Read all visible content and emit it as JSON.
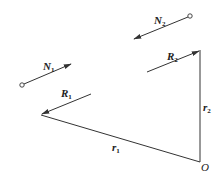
{
  "diagram": {
    "type": "vector-triangle",
    "colors": {
      "stroke": "#333333",
      "background": "#ffffff"
    },
    "labels": {
      "N2": {
        "main": "N",
        "sub": "2"
      },
      "N1": {
        "main": "N",
        "sub": "1"
      },
      "R2": {
        "main": "R",
        "sub": "2"
      },
      "R1": {
        "main": "R",
        "sub": "1"
      },
      "r2": {
        "main": "r",
        "sub": "2"
      },
      "r1": {
        "main": "r",
        "sub": "1"
      },
      "O": {
        "main": "O"
      }
    },
    "vectors": [
      {
        "name": "N2",
        "from": [
          190,
          16
        ],
        "to": [
          134,
          39
        ],
        "tail": "circle"
      },
      {
        "name": "N1",
        "from": [
          22,
          85
        ],
        "to": [
          71,
          64
        ],
        "tail": "circle"
      },
      {
        "name": "R2",
        "from": [
          147,
          72
        ],
        "to": [
          200,
          50
        ],
        "tail": "none"
      },
      {
        "name": "R1",
        "from": [
          91,
          94
        ],
        "to": [
          41,
          115
        ],
        "tail": "none"
      }
    ],
    "segments": [
      {
        "name": "r2",
        "from": [
          200,
          50
        ],
        "to": [
          200,
          162
        ]
      },
      {
        "name": "r1",
        "from": [
          41,
          115
        ],
        "to": [
          200,
          162
        ]
      }
    ],
    "points": [
      {
        "name": "O",
        "at": [
          200,
          162
        ]
      }
    ]
  }
}
